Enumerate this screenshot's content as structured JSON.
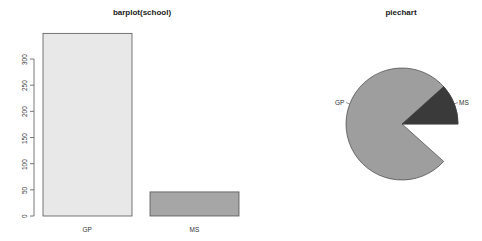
{
  "chart_data": [
    {
      "type": "bar",
      "title": "barplot(school)",
      "categories": [
        "GP",
        "MS"
      ],
      "values": [
        349,
        46
      ],
      "xlabel": "",
      "ylabel": "",
      "ylim": [
        0,
        349
      ],
      "yticks": [
        0,
        50,
        100,
        150,
        200,
        250,
        300
      ],
      "grid": false,
      "colors": [
        "#e8e8e8",
        "#a6a6a6"
      ]
    },
    {
      "type": "pie",
      "title": "piechart",
      "labels": [
        "GP",
        "MS"
      ],
      "values": [
        349,
        46
      ],
      "colors": [
        "#9e9e9e",
        "#3a3a3a"
      ]
    }
  ],
  "bar": {
    "title": "barplot(school)",
    "ytick_labels": [
      "0",
      "50",
      "100",
      "150",
      "200",
      "250",
      "300"
    ],
    "cat_labels": [
      "GP",
      "MS"
    ]
  },
  "pie": {
    "title": "piechart",
    "labels": [
      "GP",
      "MS"
    ]
  }
}
